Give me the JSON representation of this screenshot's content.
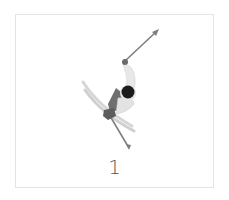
{
  "card": {
    "caption": "1",
    "figure": {
      "subject": "skier-icon",
      "colors": {
        "pole": "#8a8a8a",
        "arm": "#e6e6e6",
        "head": "#1a1a1a",
        "body": "#6e6e6e",
        "boot": "#5a5a5a",
        "skis": "#d0d0d0"
      }
    }
  }
}
